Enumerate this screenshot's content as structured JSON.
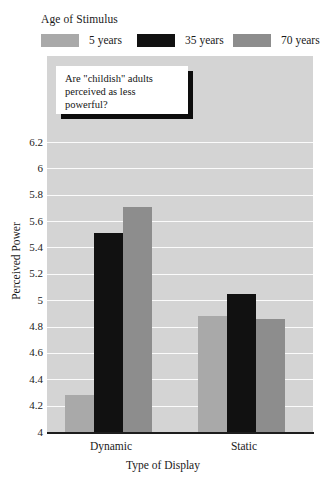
{
  "legend": {
    "title": "Age of Stimulus",
    "entries": [
      {
        "label": "5 years",
        "color": "#a9a9a9"
      },
      {
        "label": "35 years",
        "color": "#111111"
      },
      {
        "label": "70 years",
        "color": "#8d8d8d"
      }
    ]
  },
  "callout": {
    "text": "Are \"childish\" adults\nperceived as less\npowerful?"
  },
  "axes": {
    "y_label": "Perceived Power",
    "x_label": "Type of Display",
    "y_ticks": [
      "6.2",
      "6",
      "5.8",
      "5.6",
      "5.4",
      "5.2",
      "5",
      "4.8",
      "4.6",
      "4.4",
      "4.2",
      "4"
    ],
    "x_ticks": [
      "Dynamic",
      "Static"
    ]
  },
  "colors": {
    "plot_background": "#d4d4d4",
    "gridline": "#fbfbfb",
    "axis": "#1d1d1d",
    "text": "#1a1a1a",
    "callout_background": "#ffffff",
    "callout_shadow": "#0d0d0d"
  },
  "chart_data": {
    "type": "bar",
    "title": "",
    "xlabel": "Type of Display",
    "ylabel": "Perceived Power",
    "categories": [
      "Dynamic",
      "Static"
    ],
    "series": [
      {
        "name": "5 years",
        "color": "#a9a9a9",
        "values": [
          4.28,
          4.88
        ]
      },
      {
        "name": "35 years",
        "color": "#111111",
        "values": [
          5.51,
          5.05
        ]
      },
      {
        "name": "70 years",
        "color": "#8d8d8d",
        "values": [
          5.71,
          4.86
        ]
      }
    ],
    "ylim": [
      4,
      6.2
    ],
    "ytick_step": 0.2,
    "grid": true,
    "legend_position": "top",
    "legend_title": "Age of Stimulus",
    "annotations": [
      {
        "text": "Are \"childish\" adults perceived as less powerful?",
        "style": "callout-box"
      }
    ]
  }
}
